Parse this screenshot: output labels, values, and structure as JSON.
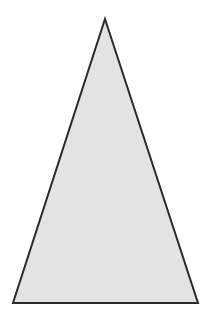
{
  "canvas": {
    "width": 212,
    "height": 320,
    "background_color": "#ffffff"
  },
  "figure": {
    "name": "triangle",
    "shape_type": "triangle",
    "classification": "isosceles",
    "fill_color": "#e3e3e3",
    "stroke_color": "#2a2a2a",
    "stroke_width": 2,
    "points": "105,19 198,303 13,303",
    "vertices": [
      {
        "label": "apex",
        "x": 105,
        "y": 19
      },
      {
        "label": "bottom-right",
        "x": 198,
        "y": 303
      },
      {
        "label": "bottom-left",
        "x": 13,
        "y": 303
      }
    ],
    "base_width": 185,
    "height_px": 284
  }
}
